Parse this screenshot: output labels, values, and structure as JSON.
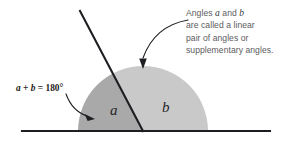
{
  "figure": {
    "background_color": "#ffffff",
    "line_color": "#1e1e22",
    "region_a_color": "#a9a9a9",
    "region_b_color": "#c9c9c9",
    "text_color": "#5c5c60"
  },
  "callout": {
    "line1_prefix": "Angles ",
    "line1_var1": "a",
    "line1_mid": " and ",
    "line1_var2": "b",
    "line2": "are called a linear",
    "line3": "pair of angles or",
    "line4": "supplementary angles."
  },
  "equation": {
    "var_a": "a",
    "plus": " + ",
    "var_b": "b",
    "equals": " = ",
    "value": "180°"
  },
  "labels": {
    "angle_a": "a",
    "angle_b": "b"
  },
  "geometry": {
    "baseline_y": 131,
    "baseline_x_start": 22,
    "baseline_x_end": 270,
    "vertex_x": 143,
    "vertex_y": 131,
    "transversal_top_x": 80,
    "transversal_top_y": 11,
    "arc_radius": 65
  }
}
